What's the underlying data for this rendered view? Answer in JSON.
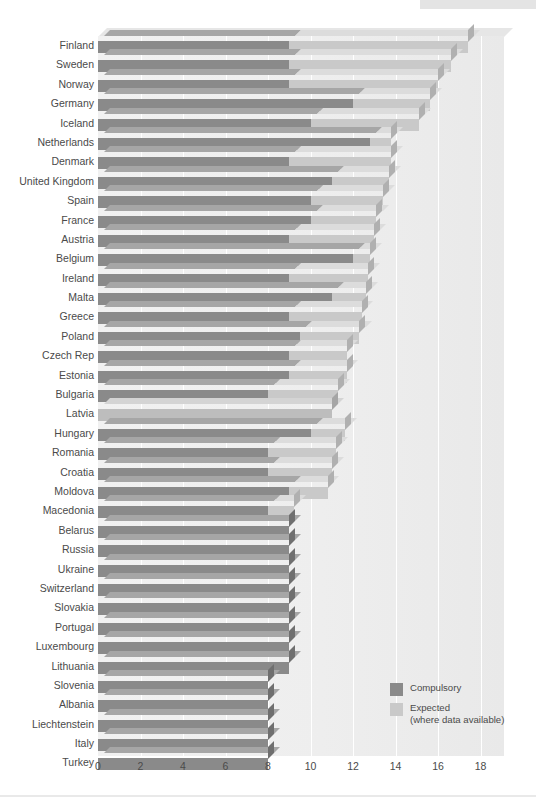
{
  "chart_data": {
    "type": "bar",
    "subtype": "stacked-horizontal-3d",
    "title": "",
    "xlabel": "",
    "ylabel": "",
    "xlim": [
      0,
      18
    ],
    "xticks": [
      0,
      2,
      4,
      6,
      8,
      10,
      12,
      14,
      16,
      18
    ],
    "xtick_labels": [
      "0",
      "2",
      "4",
      "6",
      "8",
      "10",
      "12",
      "14",
      "16",
      "18"
    ],
    "grid": "vertical",
    "legend_position": "bottom-right",
    "categories": [
      "Finland",
      "Sweden",
      "Norway",
      "Germany",
      "Iceland",
      "Netherlands",
      "Denmark",
      "United Kingdom",
      "Spain",
      "France",
      "Austria",
      "Belgium",
      "Ireland",
      "Malta",
      "Greece",
      "Poland",
      "Czech Rep",
      "Estonia",
      "Bulgaria",
      "Latvia",
      "Hungary",
      "Romania",
      "Croatia",
      "Moldova",
      "Macedonia",
      "Belarus",
      "Russia",
      "Ukraine",
      "Switzerland",
      "Slovakia",
      "Portugal",
      "Luxembourg",
      "Lithuania",
      "Slovenia",
      "Albania",
      "Liechtenstein",
      "Italy",
      "Turkey"
    ],
    "series": [
      {
        "name": "Compulsory",
        "color": "#8a8a8a",
        "values": [
          9.0,
          9.0,
          9.0,
          12.0,
          10.0,
          12.8,
          9.0,
          11.0,
          10.0,
          10.0,
          9.0,
          12.0,
          9.0,
          11.0,
          9.0,
          9.5,
          9.0,
          9.0,
          8.0,
          0.0,
          10.0,
          8.0,
          8.0,
          9.0,
          8.0,
          9.0,
          9.0,
          9.0,
          9.0,
          9.0,
          9.0,
          9.0,
          9.0,
          8.0,
          8.0,
          8.0,
          8.0,
          8.0
        ]
      },
      {
        "name": "Expected (where data available)",
        "color": "#c9c9c9",
        "values": [
          8.4,
          7.6,
          7.0,
          3.6,
          5.1,
          1.0,
          4.8,
          2.7,
          3.4,
          3.1,
          4.0,
          0.8,
          3.7,
          1.6,
          3.4,
          2.8,
          2.7,
          2.7,
          3.3,
          11.0,
          1.6,
          3.2,
          3.0,
          1.8,
          1.2,
          0.0,
          0.0,
          0.0,
          0.0,
          0.0,
          0.0,
          0.0,
          0.0,
          0.0,
          0.0,
          0.0,
          0.0,
          0.0
        ]
      }
    ],
    "totals": [
      17.4,
      16.6,
      16.0,
      15.6,
      15.1,
      13.8,
      13.8,
      13.7,
      13.4,
      13.1,
      13.0,
      12.8,
      12.7,
      12.6,
      12.4,
      12.3,
      11.7,
      11.7,
      11.3,
      11.0,
      11.6,
      11.2,
      11.0,
      10.8,
      9.2,
      9.0,
      9.0,
      9.0,
      9.0,
      9.0,
      9.0,
      9.0,
      9.0,
      8.0,
      8.0,
      8.0,
      8.0,
      8.0
    ]
  },
  "legend": {
    "items": [
      {
        "swatch": "sw-compulsory",
        "label": "Compulsory",
        "sublabel": ""
      },
      {
        "swatch": "sw-expected",
        "label": "Expected",
        "sublabel": "(where data available)"
      }
    ]
  },
  "colors": {
    "compulsory": "#8a8a8a",
    "expected": "#c9c9c9",
    "panel": "#eeeeee",
    "grid": "#ffffff",
    "text": "#4a4a4a",
    "page": "#ffffff"
  }
}
